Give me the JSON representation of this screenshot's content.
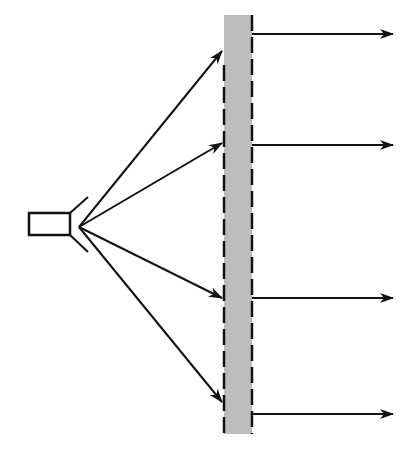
{
  "diagram": {
    "title": "",
    "colors": {
      "stroke": "#111111",
      "slab_fill": "#bdbdbd",
      "background": "#ffffff"
    },
    "source": {
      "body": {
        "x": 29,
        "y": 213,
        "w": 41,
        "h": 22
      },
      "horn_top": {
        "x1": 70,
        "y1": 213,
        "x2": 88,
        "y2": 197
      },
      "horn_bottom": {
        "x1": 70,
        "y1": 235,
        "x2": 88,
        "y2": 252
      },
      "origin": {
        "x": 79,
        "y": 227
      }
    },
    "slab": {
      "x": 224,
      "y": 15,
      "w": 28,
      "h": 419,
      "edge_style": "dashed"
    },
    "incident_rays": [
      {
        "x2": 222,
        "y2": 51
      },
      {
        "x2": 222,
        "y2": 143
      },
      {
        "x2": 222,
        "y2": 298
      },
      {
        "x2": 222,
        "y2": 402
      }
    ],
    "output_rays": [
      {
        "y": 34,
        "x1": 252,
        "x2": 393
      },
      {
        "y": 145,
        "x1": 252,
        "x2": 393
      },
      {
        "y": 298,
        "x1": 252,
        "x2": 393
      },
      {
        "y": 414,
        "x1": 252,
        "x2": 393
      }
    ]
  }
}
